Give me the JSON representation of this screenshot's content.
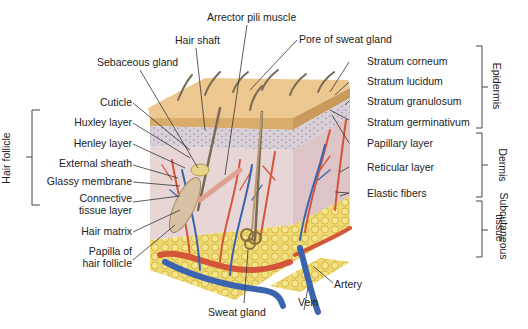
{
  "diagram": {
    "labels_top": {
      "arrector_pili_muscle": "Arrector pili muscle",
      "hair_shaft": "Hair shaft",
      "pore_of_sweat_gland": "Pore of sweat gland",
      "sebaceous_gland": "Sebaceous gland"
    },
    "labels_left": {
      "cuticle": "Cuticle",
      "huxley_layer": "Huxley layer",
      "henley_layer": "Henley layer",
      "external_sheath": "External sheath",
      "glassy_membrane": "Glassy membrane",
      "connective_tissue_layer_1": "Connective",
      "connective_tissue_layer_2": "tissue layer",
      "hair_matrix": "Hair matrix",
      "papilla_1": "Papilla of",
      "papilla_2": "hair follicle"
    },
    "labels_right": {
      "stratum_corneum": "Stratum corneum",
      "stratum_lucidum": "Stratum lucidum",
      "stratum_granulosum": "Stratum granulosum",
      "stratum_germinativum": "Stratum germinativum",
      "papillary_layer": "Papillary layer",
      "reticular_layer": "Reticular layer",
      "elastic_fibers": "Elastic fibers"
    },
    "labels_bottom": {
      "sweat_gland": "Sweat gland",
      "vein": "Vein",
      "artery": "Artery"
    },
    "groups": {
      "hair_follicle": "Hair follicle",
      "epidermis": "Epidermis",
      "dermis": "Dermis",
      "subcutaneous_1": "Subcutaneous",
      "subcutaneous_2": "tissue"
    },
    "colors": {
      "epidermis_surface": "#ecc890",
      "dermis": "#e6d2d0",
      "artery": "#d4553a",
      "vein": "#3a64b0",
      "fat": "#e8cf5a",
      "hair": "#7a6a55"
    }
  }
}
